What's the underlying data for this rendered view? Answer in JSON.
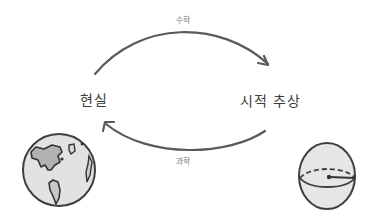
{
  "diagram": {
    "nodes": {
      "reality": {
        "label": "현실",
        "icon": "earth-globe-icon"
      },
      "abstraction": {
        "label": "시적 추상",
        "icon": "sphere-hemisphere-icon"
      }
    },
    "edges": {
      "top": {
        "from": "현실",
        "to": "시적 추상",
        "label": "수학"
      },
      "bottom": {
        "from": "시적 추상",
        "to": "현실",
        "label": "과학"
      }
    },
    "colors": {
      "stroke": "#555555",
      "fill_light": "#e4e4e4",
      "fill_dark": "#b5b5b5",
      "text": "#3c3c3c"
    }
  }
}
